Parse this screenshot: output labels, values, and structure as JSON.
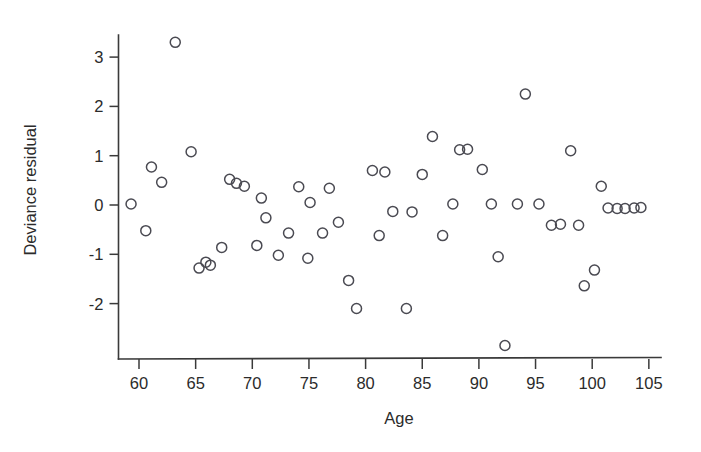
{
  "figure": {
    "background_color": "#ffffff",
    "point_color": "#4a4a52",
    "axis_color": "#3a3a3a"
  },
  "chart_data": {
    "type": "scatter",
    "title": "",
    "subtitle": "",
    "xlabel": "Age",
    "ylabel": "Deviance residual",
    "xlim": [
      57.8,
      105.5
    ],
    "ylim": [
      -3.05,
      3.6
    ],
    "xticks": [
      60,
      65,
      70,
      75,
      80,
      85,
      90,
      95,
      100,
      105
    ],
    "xtick_labels": [
      "60",
      "65",
      "70",
      "75",
      "80",
      "85",
      "90",
      "95",
      "100",
      "105"
    ],
    "yticks": [
      -2,
      -1,
      0,
      1,
      2,
      3
    ],
    "ytick_labels": [
      "-2",
      "-1",
      "0",
      "1",
      "2",
      "3"
    ],
    "grid": false,
    "legend": null,
    "marker": "open-circle",
    "marker_size": 5,
    "n_points": 57,
    "x": [
      59.3,
      60.6,
      61.1,
      62.0,
      63.2,
      64.6,
      65.3,
      65.9,
      66.3,
      67.3,
      68.0,
      68.6,
      69.3,
      70.4,
      70.8,
      71.2,
      72.3,
      73.2,
      74.1,
      74.9,
      75.1,
      76.2,
      76.8,
      77.6,
      78.5,
      79.2,
      80.6,
      81.2,
      81.7,
      82.4,
      83.6,
      84.1,
      85.0,
      85.9,
      86.8,
      87.7,
      88.3,
      89.0,
      90.3,
      91.1,
      91.7,
      92.3,
      93.4,
      94.1,
      95.3,
      96.4,
      97.2,
      98.1,
      98.8,
      99.3,
      100.2,
      100.8,
      101.4,
      102.2,
      102.9,
      103.7,
      104.3
    ],
    "y": [
      0.02,
      -0.52,
      0.77,
      0.46,
      3.3,
      1.08,
      -1.28,
      -1.16,
      -1.22,
      -0.86,
      0.52,
      0.44,
      0.38,
      -0.82,
      0.14,
      -0.26,
      -1.02,
      -0.57,
      0.37,
      -1.08,
      0.05,
      -0.57,
      0.34,
      -0.35,
      -1.53,
      -2.1,
      0.7,
      -0.62,
      0.67,
      -0.13,
      -2.1,
      -0.14,
      0.62,
      1.39,
      -0.62,
      0.02,
      1.12,
      1.13,
      0.72,
      0.02,
      -1.05,
      -2.85,
      0.02,
      2.25,
      0.02,
      -0.41,
      -0.39,
      1.1,
      -0.41,
      -1.64,
      -1.32,
      0.38,
      -0.06,
      -0.07,
      -0.07,
      -0.06,
      -0.05
    ]
  },
  "axis": {
    "x_title": "Age",
    "y_title": "Deviance residual"
  }
}
